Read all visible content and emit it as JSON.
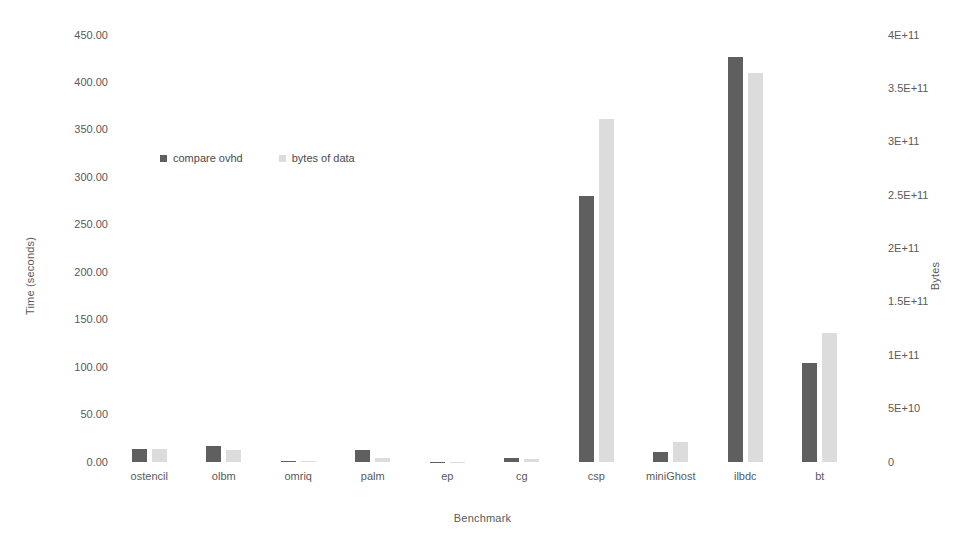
{
  "chart_data": {
    "type": "bar",
    "title": "",
    "subtitle": "",
    "xlabel": "Benchmark",
    "ylabel": "Time (seconds)",
    "y2label": "Bytes",
    "grid": false,
    "legend_position": "inside-upper-left",
    "categories": [
      "ostencil",
      "olbm",
      "omriq",
      "palm",
      "ep",
      "cg",
      "csp",
      "miniGhost",
      "ilbdc",
      "bt"
    ],
    "ylim": [
      0,
      450
    ],
    "yticks": [
      0,
      50,
      100,
      150,
      200,
      250,
      300,
      350,
      400,
      450
    ],
    "ytick_labels": [
      "0.00",
      "50.00",
      "100.00",
      "150.00",
      "200.00",
      "250.00",
      "300.00",
      "350.00",
      "400.00",
      "450.00"
    ],
    "y2lim": [
      0,
      400000000000
    ],
    "y2ticks": [
      0,
      50000000000,
      100000000000,
      150000000000,
      200000000000,
      250000000000,
      300000000000,
      350000000000,
      400000000000
    ],
    "y2tick_labels": [
      "0",
      "5E+10",
      "1E+11",
      "1.5E+11",
      "2E+11",
      "2.5E+11",
      "3E+11",
      "3.5E+11",
      "4E+11"
    ],
    "series": [
      {
        "name": "compare ovhd",
        "axis": "left",
        "color": "#5f5f5f",
        "values": [
          13.7,
          17.0,
          0.6,
          12.6,
          0.2,
          4.2,
          280.0,
          10.5,
          427.0,
          104.0
        ]
      },
      {
        "name": "bytes of data",
        "axis": "right",
        "color": "#dcdcdc",
        "values": [
          12500000000,
          11000000000,
          900000000,
          3700000000,
          400000000,
          3000000000,
          321000000000,
          18500000000,
          364000000000,
          121000000000
        ]
      }
    ]
  },
  "legend": {
    "entries": [
      {
        "label": "compare ovhd",
        "swatch": "series-a"
      },
      {
        "label": "bytes of data",
        "swatch": "series-b"
      }
    ]
  },
  "colors": {
    "series_a": "#5f5f5f",
    "series_b": "#dcdcdc",
    "text": "#5a5a5a",
    "background": "#ffffff"
  }
}
